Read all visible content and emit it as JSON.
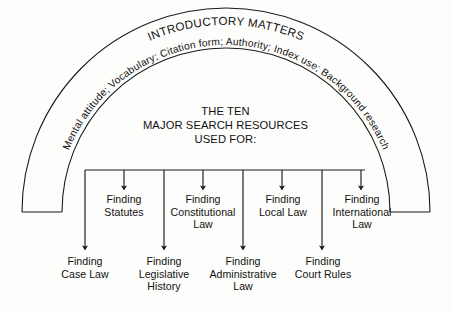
{
  "figure": {
    "arc_title": "INTRODUCTORY MATTERS",
    "arc_items_text": "Mental attitude;  Vocabulary;   Citation form;   Authority;   Index use;   Background research",
    "arc_items": [
      "Mental attitude;",
      "Vocabulary;",
      "Citation form;",
      "Authority;",
      "Index use;",
      "Background research"
    ],
    "center": {
      "line1": "THE TEN",
      "line2": "MAJOR SEARCH RESOURCES",
      "line3": "USED FOR:"
    },
    "upper_nodes": [
      {
        "line1": "Finding",
        "line2": "Statutes",
        "line3": ""
      },
      {
        "line1": "Finding",
        "line2": "Constitutional",
        "line3": "Law"
      },
      {
        "line1": "Finding",
        "line2": "Local Law",
        "line3": ""
      },
      {
        "line1": "Finding",
        "line2": "International",
        "line3": "Law"
      }
    ],
    "lower_nodes": [
      {
        "line1": "Finding",
        "line2": "Case Law",
        "line3": ""
      },
      {
        "line1": "Finding",
        "line2": "Legislative",
        "line3": "History"
      },
      {
        "line1": "Finding",
        "line2": "Administrative",
        "line3": "Law"
      },
      {
        "line1": "Finding",
        "line2": "Court Rules",
        "line3": ""
      }
    ],
    "colors": {
      "ink": "#111111",
      "background": "#fdfdfb",
      "line": "#1a1a1a"
    }
  }
}
